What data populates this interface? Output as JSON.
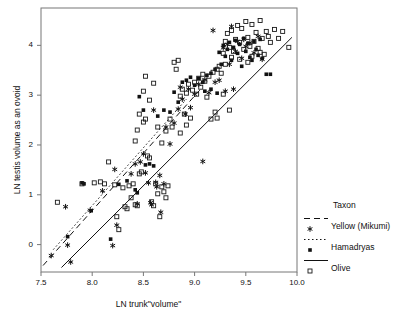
{
  "chart_data": {
    "type": "scatter",
    "title": "",
    "xlabel": "LN trunk\"volume\"",
    "ylabel": "LN testis volume as an ovoid",
    "xlim": [
      7.5,
      10.0
    ],
    "ylim": [
      -0.55,
      4.75
    ],
    "xticks": [
      7.5,
      8.0,
      8.5,
      9.0,
      9.5,
      10.0
    ],
    "xtick_labels": [
      "7.5",
      "8.0",
      "8.5",
      "9.0",
      "9.5",
      "10.0"
    ],
    "yticks": [
      0,
      1,
      2,
      3,
      4
    ],
    "ytick_labels": [
      "0",
      "1",
      "2",
      "3",
      "4"
    ],
    "grid": false,
    "frame": true,
    "legend": {
      "title": "Taxon",
      "position": "right-outside",
      "entries": [
        {
          "label": "Yellow (Mikumi)",
          "marker": "asterisk",
          "line": "dashed",
          "color": "#111111"
        },
        {
          "label": "Hamadryas",
          "marker": "filled-square",
          "line": "dotted",
          "color": "#111111"
        },
        {
          "label": "Olive",
          "marker": "open-square",
          "line": "solid",
          "color": "#111111"
        }
      ]
    },
    "series": [
      {
        "name": "Yellow (Mikumi)",
        "marker": "asterisk",
        "fit_line": "dashed",
        "points": [
          [
            7.6,
            -0.22
          ],
          [
            7.74,
            0.76
          ],
          [
            7.76,
            -0.01
          ],
          [
            7.79,
            -0.35
          ],
          [
            7.98,
            0.69
          ],
          [
            8.1,
            1.08
          ],
          [
            8.22,
            1.51
          ],
          [
            8.2,
            -0.02
          ],
          [
            8.24,
            0.39
          ],
          [
            8.38,
            1.42
          ],
          [
            8.42,
            1.62
          ],
          [
            8.44,
            0.82
          ],
          [
            8.47,
            1.66
          ],
          [
            8.5,
            1.82
          ],
          [
            8.52,
            1.44
          ],
          [
            8.55,
            1.24
          ],
          [
            8.57,
            0.84
          ],
          [
            8.58,
            0.8
          ],
          [
            8.6,
            2.7
          ],
          [
            8.62,
            1.25
          ],
          [
            8.63,
            1.16
          ],
          [
            8.66,
            1.39
          ],
          [
            8.67,
            0.65
          ],
          [
            8.7,
            1.22
          ],
          [
            8.72,
            2.36
          ],
          [
            8.76,
            2.02
          ],
          [
            8.8,
            2.44
          ],
          [
            8.84,
            2.72
          ],
          [
            8.86,
            3.16
          ],
          [
            8.88,
            2.92
          ],
          [
            8.91,
            2.62
          ],
          [
            8.94,
            3.12
          ],
          [
            8.96,
            2.75
          ],
          [
            9.0,
            3.02
          ],
          [
            9.04,
            3.22
          ],
          [
            9.08,
            1.67
          ],
          [
            9.1,
            3.31
          ],
          [
            9.14,
            3.05
          ],
          [
            9.18,
            4.3
          ],
          [
            9.2,
            3.26
          ],
          [
            9.24,
            3.3
          ],
          [
            9.28,
            3.95
          ],
          [
            9.3,
            3.08
          ],
          [
            9.32,
            4.02
          ],
          [
            9.34,
            3.62
          ],
          [
            9.36,
            4.38
          ],
          [
            9.38,
            3.12
          ],
          [
            9.4,
            3.88
          ],
          [
            9.42,
            4.08
          ],
          [
            9.46,
            3.74
          ],
          [
            9.48,
            4.12
          ],
          [
            9.5,
            3.98
          ],
          [
            9.54,
            4.05
          ],
          [
            9.58,
            3.85
          ],
          [
            9.62,
            4.18
          ],
          [
            9.66,
            3.72
          ]
        ],
        "fit": {
          "x0": 7.52,
          "y0": -0.42,
          "x1": 9.05,
          "y1": 3.1
        }
      },
      {
        "name": "Hamadryas",
        "marker": "filled-square",
        "fit_line": "dotted",
        "points": [
          [
            7.76,
            0.16
          ],
          [
            7.9,
            1.24
          ],
          [
            7.92,
            1.22
          ],
          [
            7.99,
            0.68
          ],
          [
            8.18,
            0.11
          ],
          [
            8.26,
            1.21
          ],
          [
            8.34,
            1.28
          ],
          [
            8.42,
            1.1
          ],
          [
            8.44,
            1.04
          ],
          [
            8.46,
            2.97
          ],
          [
            8.5,
            2.7
          ],
          [
            8.52,
            1.6
          ],
          [
            8.56,
            1.62
          ],
          [
            8.6,
            1.58
          ],
          [
            8.64,
            2.58
          ],
          [
            8.7,
            2.7
          ],
          [
            8.76,
            2.66
          ],
          [
            8.8,
            3.06
          ],
          [
            8.84,
            2.86
          ],
          [
            8.88,
            3.26
          ],
          [
            8.92,
            3.3
          ],
          [
            8.96,
            3.36
          ],
          [
            9.0,
            3.2
          ],
          [
            9.04,
            3.34
          ],
          [
            9.08,
            3.26
          ],
          [
            9.12,
            3.4
          ],
          [
            9.16,
            3.44
          ],
          [
            9.2,
            3.52
          ],
          [
            9.24,
            3.86
          ],
          [
            9.26,
            3.62
          ],
          [
            9.28,
            4.0
          ],
          [
            9.3,
            3.78
          ],
          [
            9.32,
            3.92
          ],
          [
            9.34,
            4.06
          ],
          [
            9.36,
            3.7
          ],
          [
            9.38,
            3.96
          ],
          [
            9.4,
            4.1
          ],
          [
            9.42,
            3.84
          ],
          [
            9.44,
            4.02
          ],
          [
            9.46,
            3.58
          ],
          [
            9.48,
            4.14
          ],
          [
            9.5,
            3.88
          ],
          [
            9.52,
            4.04
          ],
          [
            9.54,
            3.76
          ],
          [
            9.56,
            3.7
          ],
          [
            9.58,
            4.08
          ],
          [
            9.6,
            3.92
          ],
          [
            9.62,
            3.8
          ],
          [
            9.64,
            4.12
          ],
          [
            9.66,
            3.74
          ],
          [
            9.7,
            3.42
          ],
          [
            9.74,
            3.42
          ],
          [
            9.1,
            3.08
          ],
          [
            9.16,
            3.12
          ],
          [
            9.22,
            3.04
          ]
        ],
        "fit": {
          "x0": 7.62,
          "y0": -0.1,
          "x1": 8.92,
          "y1": 2.92
        }
      },
      {
        "name": "Olive",
        "marker": "open-square",
        "fit_line": "solid",
        "points": [
          [
            7.66,
            0.85
          ],
          [
            7.9,
            1.22
          ],
          [
            8.02,
            1.24
          ],
          [
            8.08,
            1.26
          ],
          [
            8.12,
            1.22
          ],
          [
            8.16,
            1.66
          ],
          [
            8.22,
            1.2
          ],
          [
            8.24,
            0.56
          ],
          [
            8.26,
            0.3
          ],
          [
            8.3,
            1.14
          ],
          [
            8.32,
            0.76
          ],
          [
            8.34,
            0.72
          ],
          [
            8.36,
            1.18
          ],
          [
            8.38,
            0.94
          ],
          [
            8.4,
            1.22
          ],
          [
            8.42,
            0.8
          ],
          [
            8.44,
            0.78
          ],
          [
            8.46,
            1.42
          ],
          [
            8.48,
            1.46
          ],
          [
            8.5,
            2.46
          ],
          [
            8.52,
            2.52
          ],
          [
            8.54,
            1.78
          ],
          [
            8.56,
            1.74
          ],
          [
            8.58,
            0.86
          ],
          [
            8.6,
            0.78
          ],
          [
            8.62,
            1.22
          ],
          [
            8.64,
            1.02
          ],
          [
            8.66,
            0.56
          ],
          [
            8.68,
            1.16
          ],
          [
            8.7,
            1.06
          ],
          [
            8.72,
            0.94
          ],
          [
            8.74,
            1.18
          ],
          [
            8.42,
            2.08
          ],
          [
            8.44,
            2.3
          ],
          [
            8.46,
            2.62
          ],
          [
            8.5,
            3.08
          ],
          [
            8.52,
            3.38
          ],
          [
            8.56,
            2.9
          ],
          [
            8.6,
            3.24
          ],
          [
            8.64,
            2.36
          ],
          [
            8.68,
            2.04
          ],
          [
            8.72,
            2.28
          ],
          [
            8.76,
            2.52
          ],
          [
            8.78,
            2.36
          ],
          [
            8.8,
            3.66
          ],
          [
            8.82,
            3.52
          ],
          [
            8.84,
            3.7
          ],
          [
            8.86,
            2.98
          ],
          [
            8.88,
            3.12
          ],
          [
            8.9,
            2.62
          ],
          [
            8.92,
            3.04
          ],
          [
            8.94,
            3.22
          ],
          [
            8.96,
            2.54
          ],
          [
            8.98,
            3.1
          ],
          [
            9.0,
            3.26
          ],
          [
            9.02,
            3.02
          ],
          [
            9.04,
            3.34
          ],
          [
            9.06,
            3.16
          ],
          [
            9.08,
            3.42
          ],
          [
            9.1,
            3.28
          ],
          [
            9.12,
            2.96
          ],
          [
            9.14,
            3.38
          ],
          [
            9.16,
            2.52
          ],
          [
            9.18,
            3.46
          ],
          [
            9.2,
            2.66
          ],
          [
            9.22,
            3.52
          ],
          [
            9.24,
            3.58
          ],
          [
            9.26,
            3.44
          ],
          [
            9.28,
            3.84
          ],
          [
            9.3,
            3.62
          ],
          [
            9.32,
            4.24
          ],
          [
            9.34,
            3.96
          ],
          [
            9.36,
            4.3
          ],
          [
            9.38,
            3.88
          ],
          [
            9.4,
            4.12
          ],
          [
            9.42,
            4.4
          ],
          [
            9.44,
            4.06
          ],
          [
            9.46,
            4.34
          ],
          [
            9.48,
            3.92
          ],
          [
            9.5,
            4.48
          ],
          [
            9.52,
            4.16
          ],
          [
            9.54,
            3.98
          ],
          [
            9.56,
            4.42
          ],
          [
            9.58,
            4.08
          ],
          [
            9.6,
            4.26
          ],
          [
            9.62,
            3.94
          ],
          [
            9.64,
            4.5
          ],
          [
            9.66,
            4.14
          ],
          [
            9.68,
            3.82
          ],
          [
            9.7,
            4.28
          ],
          [
            9.72,
            4.18
          ],
          [
            9.74,
            4.06
          ],
          [
            9.78,
            4.32
          ],
          [
            9.82,
            4.14
          ],
          [
            9.86,
            4.28
          ],
          [
            9.92,
            3.96
          ],
          [
            9.3,
            4.08
          ],
          [
            9.36,
            3.76
          ],
          [
            9.44,
            3.72
          ],
          [
            9.52,
            3.66
          ],
          [
            9.56,
            3.78
          ],
          [
            9.64,
            3.86
          ],
          [
            9.28,
            3.02
          ],
          [
            9.34,
            2.7
          ],
          [
            9.22,
            2.54
          ],
          [
            8.86,
            2.24
          ],
          [
            8.92,
            2.4
          ]
        ],
        "fit": {
          "x0": 7.7,
          "y0": -0.46,
          "x1": 9.95,
          "y1": 4.16
        }
      }
    ]
  }
}
